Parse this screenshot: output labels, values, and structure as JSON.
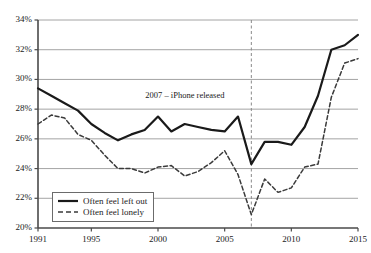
{
  "chart_data": {
    "type": "line",
    "title": "",
    "subtitle": "",
    "xlabel": "",
    "ylabel": "",
    "xlim": [
      1991,
      2015
    ],
    "ylim": [
      20,
      34
    ],
    "ytick_step": 2,
    "grid": "horizontal",
    "value_suffix": "%",
    "legend_position": "inside bottom-left",
    "x": [
      1991,
      1992,
      1993,
      1994,
      1995,
      1996,
      1997,
      1998,
      1999,
      2000,
      2001,
      2002,
      2003,
      2004,
      2005,
      2006,
      2007,
      2008,
      2009,
      2010,
      2011,
      2012,
      2013,
      2014,
      2015
    ],
    "xtick_labels": [
      "1991",
      "1995",
      "2000",
      "2005",
      "2010",
      "2015"
    ],
    "xtick_values": [
      1991,
      1995,
      2000,
      2005,
      2010,
      2015
    ],
    "ytick_labels": [
      "20%",
      "22%",
      "24%",
      "26%",
      "28%",
      "30%",
      "32%",
      "34%"
    ],
    "ytick_values": [
      20,
      22,
      24,
      26,
      28,
      30,
      32,
      34
    ],
    "series": [
      {
        "name": "Often feel left out",
        "style": "solid",
        "color": "#1a1a1a",
        "values": [
          29.4,
          28.9,
          28.4,
          27.9,
          27.0,
          26.4,
          25.9,
          26.3,
          26.6,
          27.5,
          26.5,
          27.0,
          26.8,
          26.6,
          26.5,
          27.5,
          24.3,
          25.8,
          25.8,
          25.6,
          26.8,
          28.9,
          32.0,
          32.3,
          33.0
        ]
      },
      {
        "name": "Often feel lonely",
        "style": "dashed",
        "color": "#3a3a3a",
        "values": [
          27.0,
          27.6,
          27.4,
          26.3,
          25.9,
          24.9,
          24.0,
          24.0,
          23.7,
          24.1,
          24.2,
          23.5,
          23.8,
          24.4,
          25.2,
          23.6,
          20.9,
          23.3,
          22.4,
          22.7,
          24.1,
          24.3,
          28.8,
          31.1,
          31.4
        ]
      }
    ],
    "annotations": [
      {
        "text": "2007 – iPhone released",
        "x": 2007,
        "style": "vertical-dashed-line",
        "label_y": 28.9
      }
    ]
  },
  "legend": {
    "items": [
      {
        "label": "Often feel left out",
        "style": "solid"
      },
      {
        "label": "Often feel lonely",
        "style": "dashed"
      }
    ]
  },
  "colors": {
    "background": "#ffffff",
    "axis": "#4a4a4a",
    "grid": "#9a9a9a",
    "series_solid": "#1a1a1a",
    "series_dashed": "#3a3a3a",
    "annotation_line": "#8a8a8a",
    "text": "#1a1a1a"
  }
}
